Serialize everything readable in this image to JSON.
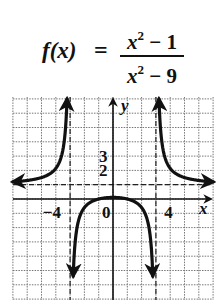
{
  "title": {
    "lhs": "f(x)",
    "equals": "=",
    "numerator": "x² − 1",
    "denominator": "x² − 9",
    "num_base": "x",
    "num_exp": "2",
    "num_rest": " − 1",
    "den_base": "x",
    "den_exp": "2",
    "den_rest": " − 9"
  },
  "chart_data": {
    "type": "line",
    "xlabel": "x",
    "ylabel": "y",
    "xlim": [
      -7,
      7
    ],
    "ylim": [
      -7,
      7
    ],
    "grid": true,
    "grid_style": "dotted",
    "tick_labels": {
      "x": [
        "-4",
        "0",
        "4"
      ],
      "y": [
        "2",
        "3"
      ]
    },
    "asymptotes": {
      "vertical": [
        -3,
        3
      ],
      "horizontal": [
        1
      ]
    },
    "series": [
      {
        "name": "left branch (x < -3)",
        "x": [
          -7,
          -6,
          -5,
          -4,
          -3.6,
          -3.3,
          -3.15
        ],
        "y": [
          1.2,
          1.3,
          1.5,
          2.14,
          2.82,
          4.86,
          8.4
        ]
      },
      {
        "name": "middle branch (-3 < x < 3)",
        "x": [
          -2.85,
          -2.7,
          -2.5,
          -2,
          -1,
          0,
          1,
          2,
          2.5,
          2.7,
          2.85
        ],
        "y": [
          -7.5,
          -3.9,
          -2.0,
          -0.6,
          0,
          0.11,
          0,
          -0.6,
          -2.0,
          -3.9,
          -7.5
        ]
      },
      {
        "name": "right branch (x > 3)",
        "x": [
          3.15,
          3.3,
          3.6,
          4,
          5,
          6,
          7
        ],
        "y": [
          8.4,
          4.86,
          2.82,
          2.14,
          1.5,
          1.3,
          1.2
        ]
      }
    ]
  }
}
